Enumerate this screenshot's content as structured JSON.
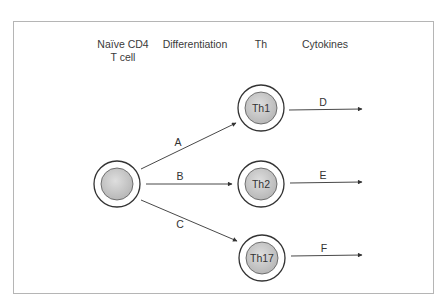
{
  "headers": {
    "naive_line1": "Naïve CD4",
    "naive_line2": "T cell",
    "differentiation": "Differentiation",
    "th": "Th",
    "cytokines": "Cytokines"
  },
  "cells": {
    "naive": "",
    "th1": "Th1",
    "th2": "Th2",
    "th17": "Th17"
  },
  "arrows": {
    "differentiation": [
      "A",
      "B",
      "C"
    ],
    "cytokines": [
      "D",
      "E",
      "F"
    ]
  },
  "colors": {
    "line": "#333333",
    "cell_fill": "#c8c8c8",
    "frame": "#b5b5b5"
  }
}
